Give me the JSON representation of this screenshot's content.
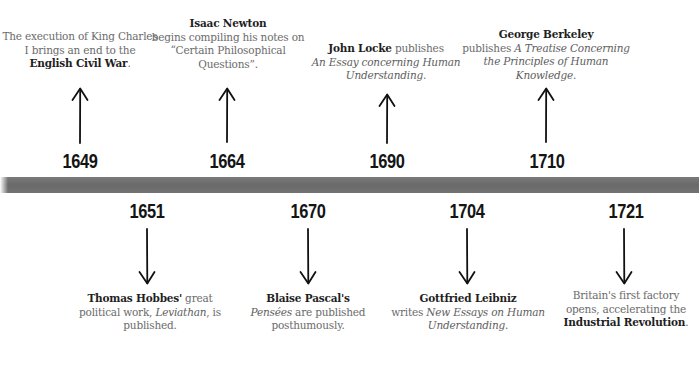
{
  "timeline": {
    "bar_color": "#6e6e6e",
    "top_events": [
      {
        "year": "1649",
        "desc_pre": "The execution of King Charles I brings an end to the ",
        "desc_bold": "English Civil War",
        "desc_post": "."
      },
      {
        "year": "1664",
        "desc_bold": "Isaac Newton",
        "desc_post": " begins compiling his notes on “Certain Philosophical Questions”."
      },
      {
        "year": "1690",
        "desc_bold": "John Locke",
        "desc_mid": " publishes ",
        "desc_italic": "An Essay concerning Human Understanding",
        "desc_post": "."
      },
      {
        "year": "1710",
        "desc_bold": "George Berkeley",
        "desc_mid": " publishes ",
        "desc_italic": "A Treatise Concerning the Principles of Human Knowledge",
        "desc_post": "."
      }
    ],
    "bottom_events": [
      {
        "year": "1651",
        "desc_bold": "Thomas Hobbes'",
        "desc_mid": " great political work, ",
        "desc_italic": "Leviathan",
        "desc_post": ", is published."
      },
      {
        "year": "1670",
        "desc_bold": "Blaise Pascal's",
        "desc_italic": "Pensées",
        "desc_post": " are published posthumously."
      },
      {
        "year": "1704",
        "desc_bold": "Gottfried Leibniz",
        "desc_mid": " writes ",
        "desc_italic": "New Essays on Human Understanding",
        "desc_post": "."
      },
      {
        "year": "1721",
        "desc_pre": "Britain's first factory opens, accelerating the ",
        "desc_bold": "Industrial Revolution",
        "desc_post": "."
      }
    ]
  }
}
